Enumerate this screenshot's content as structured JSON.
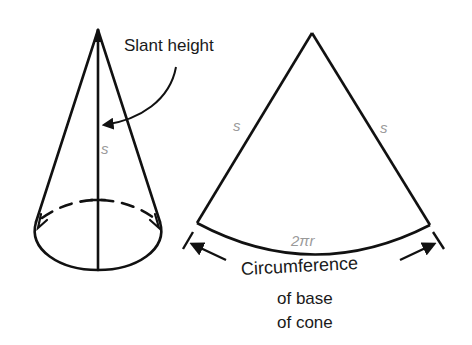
{
  "cone": {
    "slant_label": "Slant height",
    "s_label": "s"
  },
  "sector": {
    "left_side_label": "s",
    "right_side_label": "s",
    "arc_label": "2πr",
    "caption_line1": "Circumference",
    "caption_line2": "of base",
    "caption_line3": "of cone"
  },
  "colors": {
    "stroke": "#111111",
    "variable_text": "#9a9a9a"
  }
}
